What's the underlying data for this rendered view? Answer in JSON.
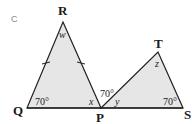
{
  "figure": {
    "label": "C",
    "fill_color": "#e6e6e6",
    "stroke_color": "#222222"
  },
  "vertices": {
    "R": "R",
    "Q": "Q",
    "P": "P",
    "T": "T",
    "S": "S"
  },
  "angles": {
    "Q": "70°",
    "RPT": "70°",
    "S": "70°",
    "R": "w",
    "RPQ": "x",
    "TPS": "y",
    "T": "z"
  },
  "marks": {
    "equal_sides": [
      "RQ",
      "RP"
    ]
  }
}
